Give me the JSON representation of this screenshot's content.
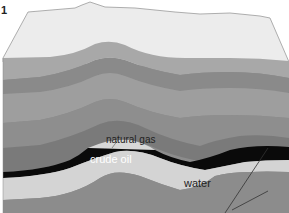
{
  "figure": {
    "number": "1"
  },
  "labels": {
    "natural_gas": "natural gas",
    "crude_oil": "crude oil",
    "water": "water"
  },
  "colors": {
    "surface": "#ececec",
    "surface_edge": "#9a9a9a",
    "layer_1": "#a8a8a8",
    "layer_2": "#8a8a8a",
    "layer_3": "#9e9e9e",
    "layer_4": "#8e8e8e",
    "layer_5": "#7a7a7a",
    "gas": "#d8d8d8",
    "oil": "#0a0a0a",
    "water": "#d4d4d4",
    "base": "#8c8c8c",
    "fault_line": "#333333"
  }
}
